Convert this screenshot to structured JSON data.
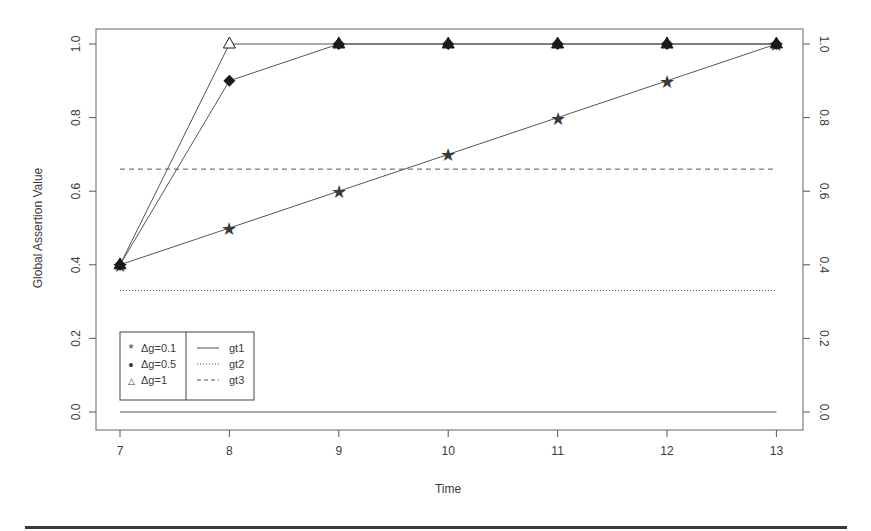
{
  "chart_data": {
    "type": "line",
    "title": "",
    "xlabel": "Time",
    "ylabel": "Global Assertion Value",
    "x": [
      7,
      8,
      9,
      10,
      11,
      12,
      13
    ],
    "xlim": [
      7,
      13
    ],
    "ylim": [
      0.0,
      1.0
    ],
    "x_ticks": [
      "7",
      "8",
      "9",
      "10",
      "11",
      "12",
      "13"
    ],
    "y_ticks_left": [
      "0.0",
      "0.2",
      "0.4",
      "0.6",
      "0.8",
      "1.0"
    ],
    "y_ticks_right": [
      "0.0",
      "0.2",
      "0.4",
      "0.6",
      "0.8",
      "1.0"
    ],
    "grid": false,
    "series": [
      {
        "name": "Δg=0.1",
        "marker": "star",
        "values": [
          0.4,
          0.5,
          0.6,
          0.7,
          0.8,
          0.9,
          1.0
        ]
      },
      {
        "name": "Δg=0.5",
        "marker": "filled-diamond",
        "values": [
          0.4,
          0.9,
          1.0,
          1.0,
          1.0,
          1.0,
          1.0
        ]
      },
      {
        "name": "Δg=1",
        "marker": "open-triangle",
        "values": [
          0.4,
          1.0,
          1.0,
          1.0,
          1.0,
          1.0,
          1.0
        ]
      }
    ],
    "thresholds": [
      {
        "name": "gt1",
        "style": "solid",
        "value": 0.0
      },
      {
        "name": "gt2",
        "style": "dotted",
        "value": 0.33
      },
      {
        "name": "gt3",
        "style": "dashed",
        "value": 0.66
      }
    ],
    "legend": {
      "position": "bottom-left",
      "left_column": [
        {
          "symbol": "*",
          "label": "Δg=0.1"
        },
        {
          "symbol": "•",
          "label": "Δg=0.5"
        },
        {
          "symbol": "△",
          "label": "Δg=1"
        }
      ],
      "right_column": [
        {
          "line": "solid",
          "label": "gt1"
        },
        {
          "line": "dotted",
          "label": "gt2"
        },
        {
          "line": "dashed",
          "label": "gt3"
        }
      ]
    }
  },
  "colors": {
    "line": "#555555",
    "marker": "#1a1a1a",
    "axis": "#555555",
    "text": "#3a3a3a"
  }
}
